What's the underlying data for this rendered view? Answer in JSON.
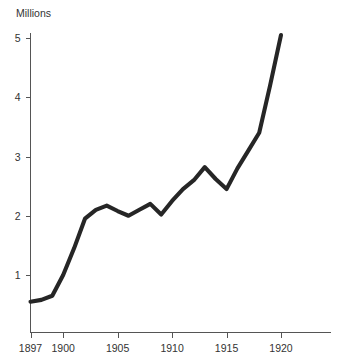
{
  "chart_data": {
    "type": "line",
    "title": "",
    "subtitle": "",
    "xlabel": "",
    "ylabel": "Millions",
    "ylabel_position": "top-left",
    "grid": false,
    "legend": false,
    "legend_position": "none",
    "line_color": "#262626",
    "axis_color": "#555555",
    "text_color": "#333333",
    "background_color": "#ffffff",
    "xlim": [
      1897,
      1922.5
    ],
    "ylim": [
      0,
      5.35
    ],
    "x_tick_labels": [
      "1897",
      "1900",
      "1905",
      "1910",
      "1915",
      "1920"
    ],
    "x_tick_values": [
      1897,
      1900,
      1905,
      1910,
      1915,
      1920
    ],
    "y_tick_labels": [
      "1",
      "2",
      "3",
      "4",
      "5"
    ],
    "y_tick_values": [
      1,
      2,
      3,
      4,
      5
    ],
    "x": [
      1897,
      1898,
      1899,
      1900,
      1901,
      1902,
      1903,
      1904,
      1905,
      1906,
      1907,
      1908,
      1909,
      1910,
      1911,
      1912,
      1913,
      1914,
      1915,
      1916,
      1917,
      1918,
      1919,
      1920
    ],
    "values": [
      0.55,
      0.58,
      0.65,
      1.0,
      1.45,
      1.95,
      2.1,
      2.17,
      2.08,
      2.0,
      2.1,
      2.2,
      2.02,
      2.25,
      2.45,
      2.6,
      2.82,
      2.62,
      2.45,
      2.8,
      3.1,
      3.4,
      4.2,
      5.05
    ],
    "series": [
      {
        "name": "Millions",
        "values": [
          0.55,
          0.58,
          0.65,
          1.0,
          1.45,
          1.95,
          2.1,
          2.17,
          2.08,
          2.0,
          2.1,
          2.2,
          2.02,
          2.25,
          2.45,
          2.6,
          2.82,
          2.62,
          2.45,
          2.8,
          3.1,
          3.4,
          4.2,
          5.05
        ]
      }
    ]
  }
}
